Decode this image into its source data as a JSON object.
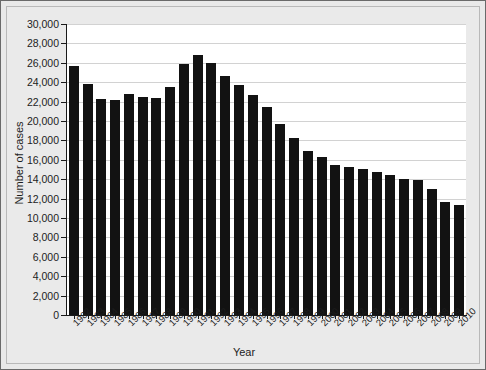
{
  "chart_data": {
    "type": "bar",
    "title": "",
    "xlabel": "Year",
    "ylabel": "Number of cases",
    "ylim": [
      0,
      30000
    ],
    "ytick_step": 2000,
    "grid": true,
    "legend": "none",
    "bar_color": "#121212",
    "plot_background": "#ffffff",
    "figure_background": "#e9e9e9",
    "ytick_labels": [
      "0",
      "2,000",
      "4,000",
      "6,000",
      "8,000",
      "10,000",
      "12,000",
      "14,000",
      "16,000",
      "18,000",
      "20,000",
      "22,000",
      "24,000",
      "26,000",
      "28,000",
      "30,000"
    ],
    "ytick_values": [
      0,
      2000,
      4000,
      6000,
      8000,
      10000,
      12000,
      14000,
      16000,
      18000,
      20000,
      22000,
      24000,
      26000,
      28000,
      30000
    ],
    "categories": [
      "1982",
      "1983",
      "1984",
      "1985",
      "1986",
      "1987",
      "1988",
      "1989",
      "1990",
      "1991",
      "1992",
      "1993",
      "1994",
      "1995",
      "1996",
      "1997",
      "1998",
      "1999",
      "2000",
      "2001",
      "2002",
      "2003",
      "2004",
      "2005",
      "2006",
      "2007",
      "2008",
      "2009",
      "2010"
    ],
    "values": [
      25700,
      23800,
      22300,
      22200,
      22800,
      22500,
      22400,
      23500,
      25900,
      26800,
      26000,
      24600,
      23700,
      22700,
      21400,
      19700,
      18200,
      16900,
      16300,
      15500,
      15300,
      15100,
      14700,
      14400,
      14000,
      13900,
      13000,
      11700,
      11300
    ],
    "series": [
      {
        "name": "Number of cases",
        "values": [
          25700,
          23800,
          22300,
          22200,
          22800,
          22500,
          22400,
          23500,
          25900,
          26800,
          26000,
          24600,
          23700,
          22700,
          21400,
          19700,
          18200,
          16900,
          16300,
          15500,
          15300,
          15100,
          14700,
          14400,
          14000,
          13900,
          13000,
          11700,
          11300
        ]
      }
    ]
  }
}
